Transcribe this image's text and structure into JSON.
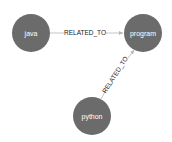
{
  "graph": {
    "nodes": [
      {
        "id": "java",
        "label": "java",
        "x": 31,
        "y": 33,
        "r": 19,
        "color": "#6b6b6b"
      },
      {
        "id": "program",
        "label": "program",
        "x": 143,
        "y": 33,
        "r": 19,
        "color": "#6b6b6b"
      },
      {
        "id": "python",
        "label": "python",
        "x": 92,
        "y": 116,
        "r": 19,
        "color": "#6b6b6b"
      }
    ],
    "edges": [
      {
        "from": "java",
        "to": "program",
        "label": "RELATED_TO"
      },
      {
        "from": "python",
        "to": "program",
        "label": "RELATED_TO"
      }
    ]
  }
}
